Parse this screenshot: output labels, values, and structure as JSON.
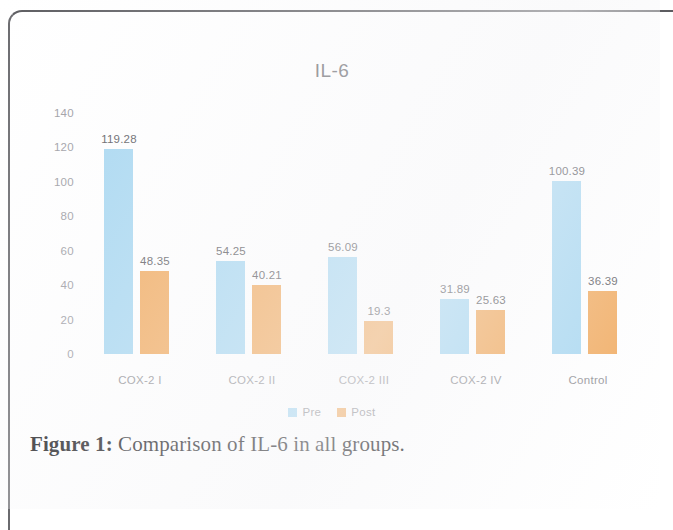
{
  "figure": {
    "caption_label": "Figure 1:",
    "caption_text": " Comparison of IL-6 in all groups."
  },
  "colors": {
    "pre": "#9DD3F0",
    "post": "#F0A04B",
    "axis_text": "#9a9a9f",
    "label_text": "#55555a",
    "title_text": "#6d6d72",
    "frame": "#5c5c60",
    "background": "#ffffff"
  },
  "legend": {
    "position": "bottom-center",
    "items": [
      {
        "name": "Pre",
        "color": "#9DD3F0"
      },
      {
        "name": "Post",
        "color": "#F0A04B"
      }
    ]
  },
  "chart_data": {
    "type": "bar",
    "title": "IL-6",
    "xlabel": "",
    "ylabel": "",
    "ylim": [
      0,
      140
    ],
    "yticks": [
      "140",
      "120",
      "100",
      "80",
      "60",
      "40",
      "20",
      "0"
    ],
    "ytick_values": [
      140,
      120,
      100,
      80,
      60,
      40,
      20,
      0
    ],
    "grid": false,
    "categories": [
      "COX-2 I",
      "COX-2 II",
      "COX-2 III",
      "COX-2 IV",
      "Control"
    ],
    "series": [
      {
        "name": "Pre",
        "color": "#9DD3F0",
        "values": [
          119.28,
          54.25,
          56.09,
          31.89,
          100.39
        ],
        "labels": [
          "119.28",
          "54.25",
          "56.09",
          "31.89",
          "100.39"
        ]
      },
      {
        "name": "Post",
        "color": "#F0A04B",
        "values": [
          48.35,
          40.21,
          19.3,
          25.63,
          36.39
        ],
        "labels": [
          "48.35",
          "40.21",
          "19.3",
          "25.63",
          "36.39"
        ]
      }
    ]
  }
}
